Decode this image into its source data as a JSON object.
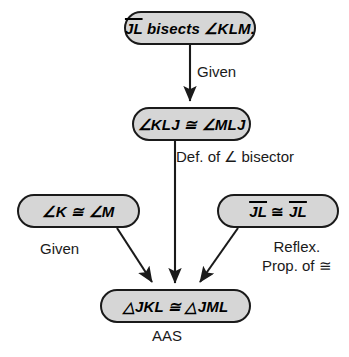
{
  "diagram": {
    "type": "flowchart-proof",
    "colors": {
      "node_fill": "#d6d6d6",
      "node_border": "#1a1a1a",
      "text": "#000000",
      "background": "#ffffff"
    },
    "nodes": {
      "top": {
        "id": "given-statement",
        "segment": "JL",
        "verb": " bisects ",
        "angle": "∠KLM."
      },
      "middle": {
        "id": "angle-congruence",
        "text": "∠KLJ ≅ ∠MLJ"
      },
      "left": {
        "id": "angle-k-congruent-angle-m",
        "text": "∠K ≅ ∠M"
      },
      "right": {
        "id": "segment-reflexive",
        "left_segment": "JL",
        "symbol": " ≅ ",
        "right_segment": "JL"
      },
      "bottom": {
        "id": "triangle-congruence",
        "text": "△JKL ≅ △JML"
      }
    },
    "labels": {
      "given_top": "Given",
      "def_bisector": "Def. of ∠ bisector",
      "given_left": "Given",
      "reflexive_line1": "Reflex.",
      "reflexive_line2": "Prop. of ≅",
      "conclusion_reason": "AAS"
    },
    "edges": [
      {
        "name": "top-to-middle",
        "from": "top",
        "to": "middle",
        "reason": "Given"
      },
      {
        "name": "middle-to-bottom",
        "from": "middle",
        "to": "bottom",
        "reason": "Def. of ∠ bisector"
      },
      {
        "name": "left-to-bottom",
        "from": "left",
        "to": "bottom",
        "reason": "Given"
      },
      {
        "name": "right-to-bottom",
        "from": "right",
        "to": "bottom",
        "reason": "Reflex. Prop. of ≅"
      }
    ]
  }
}
